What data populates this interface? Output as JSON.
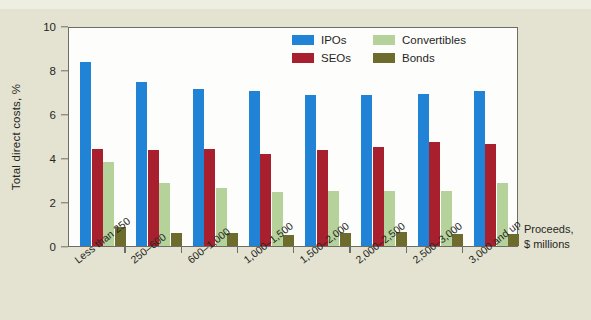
{
  "colors": {
    "background": "#e4e3d1",
    "plot_background": "#fdfdfb",
    "axis": "#6d6d66",
    "text": "#26261f",
    "ipos": "#2083d6",
    "seos": "#a8202e",
    "convertibles": "#b5d29a",
    "bonds": "#6d6c2c"
  },
  "axis_caption": {
    "line1": "Proceeds,",
    "line2": "$ millions"
  },
  "legend": {
    "items": [
      {
        "label": "IPOs",
        "color": "#2083d6",
        "key": "ipos"
      },
      {
        "label": "Convertibles",
        "color": "#b5d29a",
        "key": "convertibles"
      },
      {
        "label": "SEOs",
        "color": "#a8202e",
        "key": "seos"
      },
      {
        "label": "Bonds",
        "color": "#6d6c2c",
        "key": "bonds"
      }
    ]
  },
  "chart_data": {
    "type": "bar",
    "title": "",
    "xlabel": "Proceeds, $ millions",
    "ylabel": "Total direct costs, %",
    "ylim": [
      0,
      10
    ],
    "yticks": [
      0,
      2,
      4,
      6,
      8,
      10
    ],
    "ytick_labels": [
      "0",
      "2",
      "4",
      "6",
      "8",
      "10"
    ],
    "grid": false,
    "legend_position": "top-center",
    "categories": [
      "Less than 250",
      "250–600",
      "600–1,000",
      "1,000–1,500",
      "1,500–2,000",
      "2,000–2,500",
      "2,500–3,000",
      "3,000 and up"
    ],
    "series": [
      {
        "name": "IPOs",
        "color": "#2083d6",
        "values": [
          8.35,
          7.45,
          7.15,
          7.05,
          6.85,
          6.85,
          6.9,
          7.05
        ]
      },
      {
        "name": "SEOs",
        "color": "#a8202e",
        "values": [
          4.4,
          4.35,
          4.4,
          4.2,
          4.35,
          4.5,
          4.75,
          4.65
        ]
      },
      {
        "name": "Convertibles",
        "color": "#b5d29a",
        "values": [
          3.8,
          2.85,
          2.65,
          2.45,
          2.5,
          2.5,
          2.5,
          2.85
        ]
      },
      {
        "name": "Bonds",
        "color": "#6d6c2c",
        "values": [
          0.85,
          0.6,
          0.6,
          0.5,
          0.6,
          0.65,
          0.55,
          0.55
        ]
      }
    ]
  }
}
